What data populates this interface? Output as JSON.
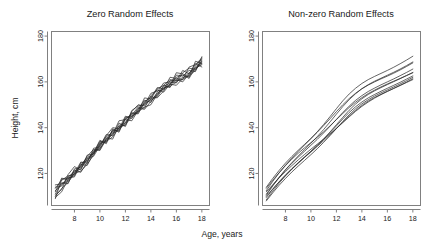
{
  "figure": {
    "width": 444,
    "height": 243,
    "background": "#ffffff",
    "ink": "#2a2a2a",
    "axis_color": "#808080"
  },
  "chart_data": {
    "type": "line",
    "title": "",
    "xlabel": "Age, years",
    "ylabel": "Height, cm",
    "xlim": [
      6.2,
      18.6
    ],
    "ylim": [
      106,
      182
    ],
    "xticks": [
      8,
      10,
      12,
      14,
      16,
      18
    ],
    "yticks": [
      120,
      140,
      160,
      180
    ],
    "xtick_labels": [
      "8",
      "10",
      "12",
      "14",
      "16",
      "18"
    ],
    "ytick_labels": [
      "120",
      "140",
      "160",
      "180"
    ],
    "grid": false,
    "legend": "none",
    "panels": [
      {
        "id": "zero-random-effects",
        "title": "Zero Random Effects",
        "note": "Noisy zig-zag trajectories about a common mean growth curve",
        "x": [
          6.5,
          7,
          7.5,
          8,
          8.5,
          9,
          9.5,
          10,
          10.5,
          11,
          11.5,
          12,
          12.5,
          13,
          13.5,
          14,
          14.5,
          15,
          15.5,
          16,
          16.5,
          17,
          17.5,
          18
        ],
        "series": [
          {
            "name": "subject-01",
            "values": [
              112.5,
              115.0,
              118.5,
              120.5,
              122.0,
              126.0,
              129.5,
              131.0,
              134.5,
              137.5,
              139.0,
              142.5,
              145.0,
              147.0,
              149.0,
              150.0,
              154.5,
              158.0,
              159.5,
              160.5,
              161.0,
              163.0,
              165.5,
              168.0
            ]
          },
          {
            "name": "subject-02",
            "values": [
              110.0,
              113.5,
              116.0,
              120.0,
              121.0,
              124.0,
              128.0,
              133.0,
              134.0,
              136.0,
              140.0,
              141.5,
              144.5,
              148.5,
              148.0,
              151.5,
              155.0,
              157.0,
              159.0,
              158.5,
              161.5,
              164.0,
              166.0,
              167.5
            ]
          },
          {
            "name": "subject-03",
            "values": [
              113.5,
              117.0,
              119.0,
              119.5,
              123.5,
              127.0,
              128.5,
              132.5,
              136.0,
              138.0,
              139.5,
              143.5,
              143.0,
              147.5,
              150.5,
              152.0,
              153.5,
              157.5,
              158.0,
              160.0,
              162.0,
              162.5,
              165.0,
              169.5
            ]
          },
          {
            "name": "subject-04",
            "values": [
              109.5,
              112.0,
              117.5,
              121.5,
              120.5,
              125.0,
              130.0,
              130.5,
              135.5,
              135.0,
              141.0,
              142.0,
              146.5,
              146.0,
              151.0,
              153.5,
              153.0,
              156.0,
              160.5,
              161.0,
              160.0,
              163.5,
              167.0,
              170.0
            ]
          },
          {
            "name": "subject-05",
            "values": [
              114.0,
              114.5,
              118.0,
              118.5,
              124.0,
              123.5,
              129.0,
              134.0,
              133.5,
              139.0,
              138.5,
              144.0,
              145.5,
              149.0,
              148.5,
              154.0,
              156.5,
              155.5,
              159.0,
              162.0,
              163.0,
              161.5,
              166.5,
              168.5
            ]
          },
          {
            "name": "subject-06",
            "values": [
              111.0,
              116.0,
              115.5,
              122.0,
              122.5,
              126.5,
              127.5,
              132.0,
              137.0,
              136.5,
              142.0,
              140.5,
              147.0,
              150.0,
              149.5,
              152.5,
              157.0,
              158.5,
              157.5,
              163.0,
              162.5,
              165.0,
              164.5,
              171.0
            ]
          },
          {
            "name": "subject-07",
            "values": [
              112.0,
              118.0,
              117.0,
              120.0,
              125.0,
              124.5,
              131.0,
              131.5,
              136.5,
              140.0,
              139.5,
              145.0,
              144.0,
              148.0,
              152.0,
              151.0,
              155.5,
              159.5,
              160.0,
              159.5,
              164.0,
              166.0,
              165.5,
              169.0
            ]
          },
          {
            "name": "subject-08",
            "values": [
              110.5,
              113.0,
              119.5,
              123.0,
              121.5,
              128.0,
              128.5,
              133.5,
              134.5,
              137.0,
              143.0,
              143.5,
              146.0,
              147.0,
              153.0,
              152.5,
              154.0,
              158.5,
              161.0,
              160.5,
              165.0,
              163.5,
              168.0,
              166.5
            ]
          },
          {
            "name": "subject-09",
            "values": [
              115.0,
              115.5,
              116.5,
              121.0,
              123.0,
              127.5,
              130.5,
              130.0,
              135.0,
              138.5,
              140.5,
              141.0,
              147.5,
              149.5,
              150.0,
              155.0,
              156.0,
              156.5,
              162.0,
              161.5,
              161.0,
              166.5,
              167.5,
              170.5
            ]
          },
          {
            "name": "subject-10",
            "values": [
              109.0,
              117.5,
              118.0,
              119.0,
              124.5,
              125.5,
              129.0,
              134.5,
              133.0,
              139.5,
              138.0,
              144.5,
              145.0,
              146.5,
              151.5,
              153.0,
              157.5,
              157.0,
              158.5,
              164.0,
              163.5,
              162.0,
              169.0,
              168.0
            ]
          }
        ]
      },
      {
        "id": "non-zero-random-effects",
        "title": "Non-zero Random Effects",
        "note": "Smooth concave subject-specific growth curves",
        "x": [
          6.5,
          7,
          7.5,
          8,
          8.5,
          9,
          9.5,
          10,
          10.5,
          11,
          11.5,
          12,
          12.5,
          13,
          13.5,
          14,
          14.5,
          15,
          15.5,
          16,
          16.5,
          17,
          17.5,
          18
        ],
        "series": [
          {
            "name": "subject-01",
            "values": [
              112.0,
              115.0,
              118.0,
              120.8,
              123.4,
              125.9,
              128.3,
              130.6,
              132.8,
              135.0,
              137.3,
              139.7,
              142.2,
              144.7,
              147.1,
              149.3,
              151.2,
              152.9,
              154.4,
              155.8,
              157.1,
              158.4,
              159.7,
              161.0
            ]
          },
          {
            "name": "subject-02",
            "values": [
              110.0,
              113.2,
              116.3,
              119.2,
              121.9,
              124.5,
              127.0,
              129.4,
              131.8,
              134.3,
              136.9,
              139.6,
              142.3,
              145.0,
              147.5,
              149.7,
              151.6,
              153.2,
              154.6,
              155.9,
              157.2,
              158.5,
              159.9,
              161.4
            ]
          },
          {
            "name": "subject-03",
            "values": [
              113.5,
              117.0,
              120.3,
              123.4,
              126.2,
              128.8,
              131.2,
              133.5,
              135.8,
              138.2,
              140.8,
              143.5,
              146.2,
              148.8,
              151.1,
              153.1,
              154.9,
              156.4,
              157.8,
              159.1,
              160.3,
              161.5,
              162.8,
              164.0
            ]
          },
          {
            "name": "subject-04",
            "values": [
              108.5,
              112.2,
              115.7,
              118.9,
              121.8,
              124.5,
              127.1,
              129.6,
              132.2,
              134.9,
              137.8,
              140.8,
              143.8,
              146.6,
              149.1,
              151.2,
              153.0,
              154.5,
              155.9,
              157.2,
              158.5,
              159.8,
              161.2,
              162.6
            ]
          },
          {
            "name": "subject-05",
            "values": [
              111.0,
              114.8,
              118.3,
              121.5,
              124.4,
              127.1,
              129.7,
              132.3,
              134.9,
              137.7,
              140.6,
              143.6,
              146.6,
              149.4,
              151.9,
              154.0,
              155.8,
              157.3,
              158.7,
              160.0,
              161.3,
              162.7,
              164.1,
              165.6
            ]
          },
          {
            "name": "subject-06",
            "values": [
              109.5,
              113.0,
              116.3,
              119.3,
              122.1,
              124.7,
              127.2,
              129.7,
              132.3,
              135.1,
              138.1,
              141.3,
              144.5,
              147.6,
              150.3,
              152.6,
              154.5,
              156.1,
              157.5,
              158.8,
              160.1,
              161.4,
              162.7,
              164.1
            ]
          },
          {
            "name": "subject-07",
            "values": [
              114.0,
              117.8,
              121.3,
              124.5,
              127.4,
              130.1,
              132.7,
              135.3,
              138.0,
              140.9,
              143.9,
              147.0,
              150.0,
              152.7,
              155.0,
              157.0,
              158.6,
              160.0,
              161.3,
              162.5,
              163.8,
              165.2,
              166.7,
              168.3
            ]
          },
          {
            "name": "subject-08",
            "values": [
              110.5,
              114.5,
              118.2,
              121.6,
              124.7,
              127.6,
              130.4,
              133.2,
              136.1,
              139.2,
              142.5,
              145.9,
              149.2,
              152.2,
              154.8,
              157.0,
              158.8,
              160.3,
              161.6,
              162.9,
              164.2,
              165.6,
              167.1,
              168.7
            ]
          },
          {
            "name": "subject-09",
            "values": [
              112.5,
              116.5,
              120.2,
              123.6,
              126.7,
              129.6,
              132.4,
              135.2,
              138.2,
              141.4,
              144.8,
              148.3,
              151.7,
              154.7,
              157.2,
              159.3,
              161.0,
              162.4,
              163.7,
              165.0,
              166.4,
              167.9,
              169.5,
              171.2
            ]
          },
          {
            "name": "subject-10",
            "values": [
              108.0,
              111.5,
              114.8,
              117.8,
              120.6,
              123.2,
              125.7,
              128.2,
              130.8,
              133.6,
              136.5,
              139.6,
              142.7,
              145.6,
              148.2,
              150.4,
              152.2,
              153.8,
              155.2,
              156.5,
              157.8,
              159.1,
              160.5,
              162.0
            ]
          }
        ]
      }
    ]
  }
}
